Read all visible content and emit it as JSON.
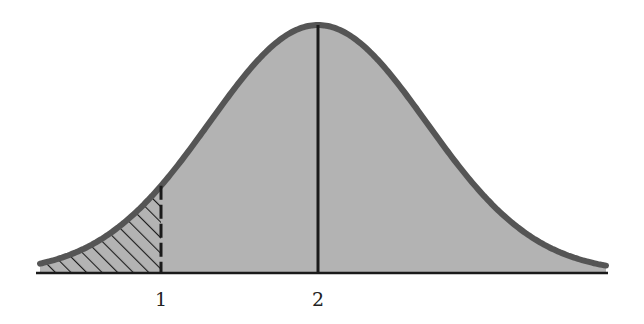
{
  "diagram": {
    "type": "normal-distribution-curve",
    "colors": {
      "fill": "#b3b3b3",
      "curve": "#555555",
      "axis": "#1a1a1a",
      "hatch": "#1a1a1a",
      "background": "#ffffff"
    },
    "axis_labels": [
      {
        "text": "1",
        "x": 161
      },
      {
        "text": "2",
        "x": 318
      }
    ],
    "mean_marker": {
      "label": "2",
      "x": 318,
      "style": "solid"
    },
    "tail_marker": {
      "label": "1",
      "x": 161,
      "style": "dashed"
    },
    "shaded_region": {
      "from": "left tail",
      "to": "1",
      "pattern": "diagonal-hatch"
    }
  }
}
